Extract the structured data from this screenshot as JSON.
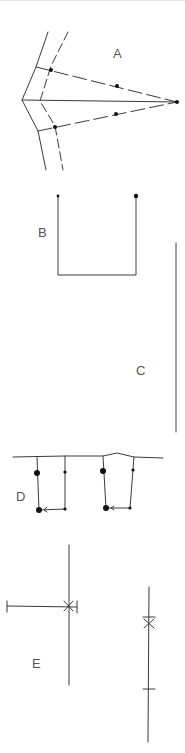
{
  "figure": {
    "background": "#ffffff",
    "stroke_color": "#3a3a3a",
    "dot_color": "#111111",
    "label_color": "#555555"
  },
  "panels": [
    {
      "id": "A",
      "label": "A",
      "description": "Two converging boundary lines with dashed rays to an apex point"
    },
    {
      "id": "B",
      "label": "B",
      "description": "U-shaped open rectangle with end points"
    },
    {
      "id": "C",
      "label": "C",
      "description": "Single vertical line"
    },
    {
      "id": "D",
      "label": "D",
      "description": "Two offset loops hanging from a baseline with directional arrows"
    },
    {
      "id": "E",
      "label": "E",
      "description": "Crossing lines with X markers and tick marks"
    }
  ],
  "labels": {
    "a": "A",
    "b": "B",
    "c": "C",
    "d": "D",
    "e": "E"
  }
}
